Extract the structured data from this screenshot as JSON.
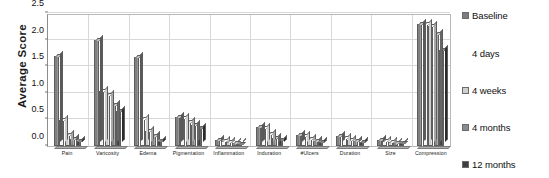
{
  "chart_data": {
    "type": "bar",
    "title": "",
    "xlabel": "",
    "ylabel": "Average Score",
    "ylim": [
      0.0,
      2.5
    ],
    "yticks": [
      "0.0",
      "0.5",
      "1.0",
      "1.5",
      "2.0",
      "2.5"
    ],
    "ytick_values": [
      0.0,
      0.5,
      1.0,
      1.5,
      2.0,
      2.5
    ],
    "grid": true,
    "legend_position": "right",
    "categories": [
      "Pain",
      "Varicosity",
      "Edema",
      "Pigmentation",
      "Inflammation",
      "Induration",
      "#Ulcers",
      "Duration",
      "Size",
      "Compression"
    ],
    "series": [
      {
        "name": "Baseline",
        "color": "#7d7d7d",
        "values": [
          1.7,
          2.0,
          1.68,
          0.55,
          0.12,
          0.35,
          0.2,
          0.18,
          0.12,
          2.3
        ]
      },
      {
        "name": "4 days",
        "color": "#f5f5f5",
        "values": [
          0.48,
          1.03,
          0.5,
          0.52,
          0.1,
          0.33,
          0.18,
          0.16,
          0.1,
          2.3
        ]
      },
      {
        "name": "4 weeks",
        "color": "#cfcfcf",
        "values": [
          0.2,
          0.95,
          0.28,
          0.45,
          0.07,
          0.22,
          0.13,
          0.12,
          0.08,
          2.25
        ]
      },
      {
        "name": "4 months",
        "color": "#8c8c8c",
        "values": [
          0.13,
          0.78,
          0.18,
          0.4,
          0.05,
          0.16,
          0.1,
          0.1,
          0.06,
          2.1
        ]
      },
      {
        "name": "12 months",
        "color": "#3f3f3f",
        "values": [
          0.1,
          0.65,
          0.1,
          0.33,
          0.04,
          0.12,
          0.08,
          0.08,
          0.05,
          1.8
        ]
      }
    ]
  },
  "legend": {
    "items": [
      {
        "label": "Baseline"
      },
      {
        "label": "4 days"
      },
      {
        "label": "4 weeks"
      },
      {
        "label": "4 months"
      },
      {
        "label": "12 months"
      }
    ]
  }
}
